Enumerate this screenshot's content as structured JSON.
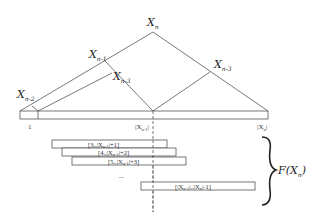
{
  "diagram": {
    "nodes": {
      "top": {
        "main": "X",
        "sub": "n"
      },
      "left_child": {
        "main": "X",
        "sub": "n-1"
      },
      "left_grandchild": {
        "main": "X",
        "sub": "n-2"
      },
      "left_inner": {
        "main": "X",
        "sub": "n-3"
      },
      "right_child": {
        "main": "X",
        "sub": "n-3"
      }
    },
    "axis": {
      "start_label": "1",
      "mid_label": "|X",
      "mid_sub": "n-1",
      "mid_close": "|",
      "end_label": "|X",
      "end_sub": "n",
      "end_close": "|"
    },
    "bars": [
      {
        "label": "[3..|X",
        "sub": "n-1",
        "tail": "|+1]"
      },
      {
        "label": "[4..|X",
        "sub": "n-1",
        "tail": "|+2]"
      },
      {
        "label": "[5..|X",
        "sub": "n-1",
        "tail": "|+3]"
      },
      {
        "label": "[|X",
        "sub": "n-1",
        "tail": "|..|X",
        "sub2": "n",
        "tail2": "|-1]"
      }
    ],
    "ellipsis": "...",
    "brace_label": {
      "main": "F(X",
      "sub": "n",
      "close": ")"
    },
    "colors": {
      "line": "#555555",
      "text": "#222222",
      "background": "#ffffff"
    }
  }
}
